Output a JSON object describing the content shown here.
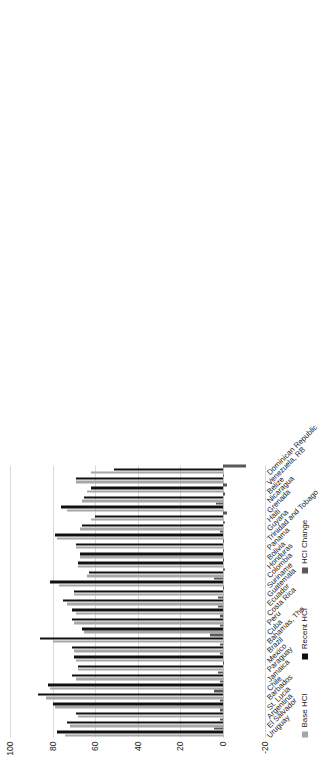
{
  "chart_data": {
    "type": "bar",
    "title": "",
    "subtitle": "",
    "xlabel": "",
    "ylabel": "",
    "orientation": "vertical-bars-rotated-90ccw",
    "grid": true,
    "legend_position": "bottom-left",
    "ylim": [
      -20,
      100
    ],
    "yticks": [
      100,
      80,
      60,
      40,
      20,
      0,
      -20
    ],
    "ytick_labels": [
      "100",
      "80",
      "60",
      "40",
      "20",
      "0",
      "-20"
    ],
    "categories": [
      "Uruguay",
      "El Salvador",
      "Argentina",
      "St. Lucia",
      "Barbados",
      "Chile",
      "Jamaica",
      "Paraguay",
      "Mexico",
      "Brazil",
      "Bahamas, The",
      "Cuba",
      "Peru",
      "Costa Rica",
      "Ecuador",
      "Guatemala",
      "Suriname",
      "Colombia",
      "Honduras",
      "Bolivia",
      "Panama",
      "Trinidad and Tobago",
      "Guyana",
      "Haiti",
      "Grenada",
      "Nicaragua",
      "Belize",
      "Venezuela, RB",
      "Dominican Republic"
    ],
    "series": [
      {
        "name": "Base HCI",
        "color": "#a6a6a6",
        "values": [
          74,
          72,
          68,
          79,
          83,
          81,
          69,
          68,
          69,
          70,
          80,
          65,
          70,
          69,
          73,
          70,
          77,
          64,
          68,
          67,
          69,
          78,
          67,
          62,
          73,
          66,
          64,
          69,
          62
        ]
      },
      {
        "name": "Recent HCI",
        "color": "#111111",
        "values": [
          78,
          73,
          69,
          80,
          87,
          82,
          71,
          68,
          70,
          71,
          86,
          66,
          71,
          71,
          75,
          70,
          81,
          63,
          68,
          67,
          69,
          79,
          66,
          60,
          76,
          65,
          62,
          69,
          51
        ]
      },
      {
        "name": "HCI Change",
        "color": "#595959",
        "values": [
          4,
          1,
          1,
          1,
          4,
          1,
          2,
          0,
          1,
          1,
          6,
          1,
          1,
          2,
          2,
          0,
          4,
          -1,
          0,
          0,
          0,
          1,
          -1,
          -2,
          3,
          -1,
          -2,
          0,
          -11
        ]
      }
    ]
  },
  "legend": {
    "items": [
      {
        "label": "Base HCI",
        "color": "#a6a6a6",
        "key": "base"
      },
      {
        "label": "Recent HCI",
        "color": "#111111",
        "key": "recent"
      },
      {
        "label": "HCI Change",
        "color": "#595959",
        "key": "change"
      }
    ]
  }
}
